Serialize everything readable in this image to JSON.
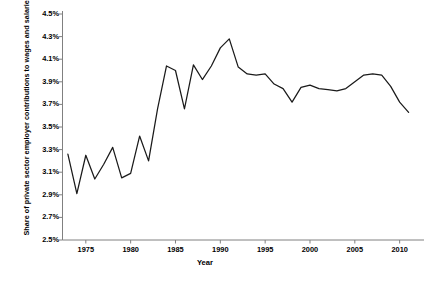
{
  "chart_data": {
    "type": "line",
    "title": "",
    "xlabel": "Year",
    "ylabel": "Share of private sector employer contributions to wages and salaries (in percent)",
    "xlim": [
      1972.4,
      2011.6
    ],
    "ylim": [
      2.5,
      4.5
    ],
    "grid": false,
    "legend": null,
    "line_color": "#1a1a1a",
    "axis_color": "#808080",
    "ytick_labels": [
      "4.5%",
      "4.3%",
      "4.1%",
      "3.9%",
      "3.7%",
      "3.5%",
      "3.3%",
      "3.1%",
      "2.9%",
      "2.7%",
      "2.5%"
    ],
    "ytick_values": [
      4.5,
      4.3,
      4.1,
      3.9,
      3.7,
      3.5,
      3.3,
      3.1,
      2.9,
      2.7,
      2.5
    ],
    "xtick_labels": [
      "1975",
      "1980",
      "1985",
      "1990",
      "1995",
      "2000",
      "2005",
      "2010"
    ],
    "xtick_values": [
      1975,
      1980,
      1985,
      1990,
      1995,
      2000,
      2005,
      2010
    ],
    "x": [
      1973,
      1974,
      1975,
      1976,
      1977,
      1978,
      1979,
      1980,
      1981,
      1982,
      1983,
      1984,
      1985,
      1986,
      1987,
      1988,
      1989,
      1990,
      1991,
      1992,
      1993,
      1994,
      1995,
      1996,
      1997,
      1998,
      1999,
      2000,
      2001,
      2002,
      2003,
      2004,
      2005,
      2006,
      2007,
      2008,
      2009,
      2010,
      2011
    ],
    "values": [
      3.26,
      2.91,
      3.25,
      3.04,
      3.17,
      3.32,
      3.05,
      3.09,
      3.42,
      3.2,
      3.66,
      4.04,
      4.0,
      3.66,
      4.05,
      3.92,
      4.04,
      4.2,
      4.28,
      4.03,
      3.97,
      3.96,
      3.97,
      3.88,
      3.84,
      3.72,
      3.85,
      3.87,
      3.84,
      3.83,
      3.82,
      3.84,
      3.9,
      3.96,
      3.97,
      3.96,
      3.86,
      3.72,
      3.63
    ],
    "series_name": "Share of private sector employer contributions"
  },
  "caption": {
    "text": ""
  }
}
